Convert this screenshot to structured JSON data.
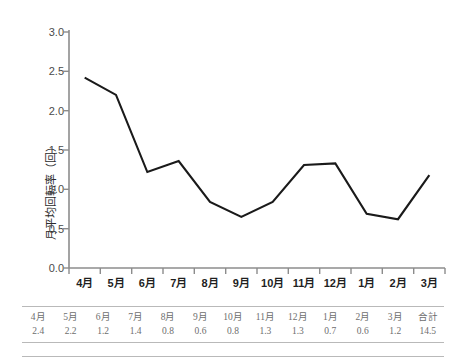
{
  "chart_data": {
    "type": "line",
    "title": "",
    "xlabel": "",
    "ylabel": "月平均回転率（回）",
    "categories": [
      "4月",
      "5月",
      "6月",
      "7月",
      "8月",
      "9月",
      "10月",
      "11月",
      "12月",
      "1月",
      "2月",
      "3月"
    ],
    "values": [
      2.42,
      2.2,
      1.22,
      1.36,
      0.84,
      0.65,
      0.84,
      1.31,
      1.33,
      0.69,
      0.62,
      1.18
    ],
    "series": [
      {
        "name": "月平均回転率",
        "values": [
          2.42,
          2.2,
          1.22,
          1.36,
          0.84,
          0.65,
          0.84,
          1.31,
          1.33,
          0.69,
          0.62,
          1.18
        ]
      }
    ],
    "ylim": [
      0.0,
      3.0
    ],
    "ytick_values": [
      0.0,
      0.5,
      1.0,
      1.5,
      2.0,
      2.5,
      3.0
    ],
    "ytick_labels": [
      "0.0",
      "0.5",
      "1.0",
      "1.5",
      "2.0",
      "2.5",
      "3.0"
    ],
    "grid": false,
    "legend": false,
    "legend_position": "none",
    "line_color": "#1a1a1a",
    "axis_color": "#8c8c8c",
    "background_color": "#ffffff"
  },
  "table": {
    "headers": [
      "4月",
      "5月",
      "6月",
      "7月",
      "8月",
      "9月",
      "10月",
      "11月",
      "12月",
      "1月",
      "2月",
      "3月",
      "合計"
    ],
    "values": [
      "2.4",
      "2.2",
      "1.2",
      "1.4",
      "0.8",
      "0.6",
      "0.8",
      "1.3",
      "1.3",
      "0.7",
      "0.6",
      "1.2",
      "14.5"
    ]
  }
}
